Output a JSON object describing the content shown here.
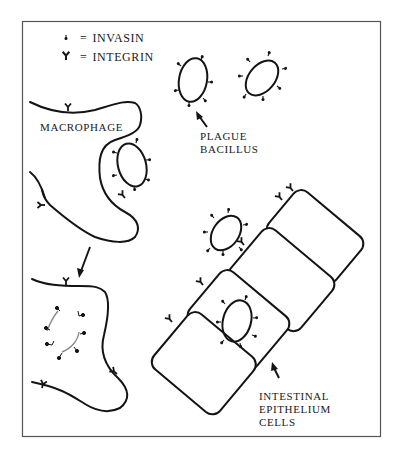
{
  "legend": {
    "items": [
      {
        "symbol": "invasin-glyph",
        "eq": "=",
        "label": "INVASIN"
      },
      {
        "symbol": "integrin-glyph",
        "eq": "=",
        "label": "INTEGRIN"
      }
    ]
  },
  "labels": {
    "macrophage": "MACROPHAGE",
    "plague_bacillus": [
      "PLAGUE",
      "BACILLUS"
    ],
    "epithelium": [
      "INTESTINAL",
      "EPITHELIUM",
      "CELLS"
    ]
  },
  "colors": {
    "ink": "#141414",
    "frame": "#555555",
    "engulfed": "#888888",
    "background": "#ffffff"
  }
}
